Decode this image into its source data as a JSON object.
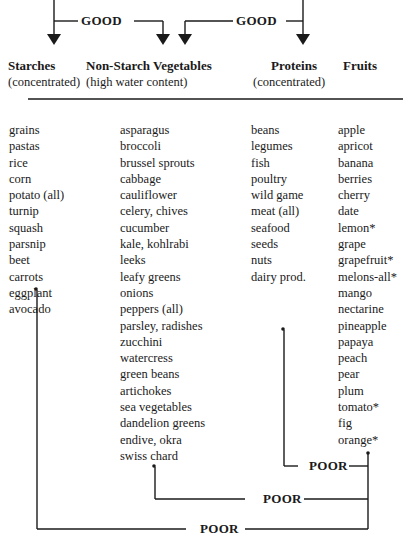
{
  "diagram": {
    "type": "food-combining-chart",
    "good_labels": [
      "GOOD",
      "GOOD"
    ],
    "poor_labels": [
      "POOR",
      "POOR",
      "POOR"
    ],
    "columns": [
      {
        "key": "starches",
        "title": "Starches",
        "subtitle": "(concentrated)",
        "items": [
          "grains",
          "pastas",
          "rice",
          "corn",
          "potato (all)",
          "turnip",
          "squash",
          "parsnip",
          "beet",
          "carrots",
          "eggplant",
          "avocado"
        ]
      },
      {
        "key": "vegetables",
        "title": "Non-Starch Vegetables",
        "subtitle": "(high water content)",
        "items": [
          "asparagus",
          "broccoli",
          "brussel sprouts",
          "cabbage",
          "cauliflower",
          "celery, chives",
          "cucumber",
          "kale, kohlrabi",
          "leeks",
          "leafy greens",
          "onions",
          "peppers (all)",
          "parsley, radishes",
          "zucchini",
          "watercress",
          "green beans",
          "artichokes",
          "sea vegetables",
          "dandelion greens",
          "endive, okra",
          "swiss chard"
        ]
      },
      {
        "key": "proteins",
        "title": "Proteins",
        "subtitle": "(concentrated)",
        "items": [
          "beans",
          "legumes",
          "fish",
          "poultry",
          "wild game",
          "meat (all)",
          "seafood",
          "seeds",
          "nuts",
          "dairy prod."
        ]
      },
      {
        "key": "fruits",
        "title": "Fruits",
        "subtitle": "",
        "items": [
          "apple",
          "apricot",
          "banana",
          "berries",
          "cherry",
          "date",
          "lemon*",
          "grape",
          "grapefruit*",
          "melons-all*",
          "mango",
          "nectarine",
          "pineapple",
          "papaya",
          "peach",
          "pear",
          "plum",
          "tomato*",
          "fig",
          "orange*"
        ]
      }
    ],
    "relationships": [
      {
        "from": "starches",
        "to": "vegetables",
        "rating": "GOOD"
      },
      {
        "from": "proteins",
        "to": "vegetables",
        "rating": "GOOD"
      },
      {
        "from": "proteins",
        "to": "fruits",
        "rating": "POOR"
      },
      {
        "from": "vegetables",
        "to": "fruits",
        "rating": "POOR"
      },
      {
        "from": "starches",
        "to": "fruits",
        "rating": "POOR"
      }
    ],
    "colors": {
      "ink": "#1a1a1a",
      "background": "#ffffff"
    }
  }
}
